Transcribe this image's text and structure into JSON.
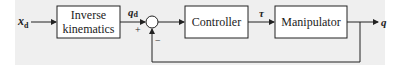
{
  "diagram": {
    "input": {
      "symbol": "x",
      "subscript": "d"
    },
    "blocks": [
      {
        "id": "inverse-kinematics",
        "line1": "Inverse",
        "line2": "kinematics"
      },
      {
        "id": "controller",
        "label": "Controller"
      },
      {
        "id": "manipulator",
        "label": "Manipulator"
      }
    ],
    "signals": {
      "desired_joint": {
        "symbol": "q",
        "subscript": "d"
      },
      "torque": {
        "symbol": "τ"
      },
      "output": {
        "symbol": "q"
      }
    },
    "summing_junction": {
      "plus": "+",
      "minus": "−"
    },
    "colors": {
      "line": "#222222",
      "background": "#efefef",
      "box_fill": "#ffffff"
    }
  }
}
